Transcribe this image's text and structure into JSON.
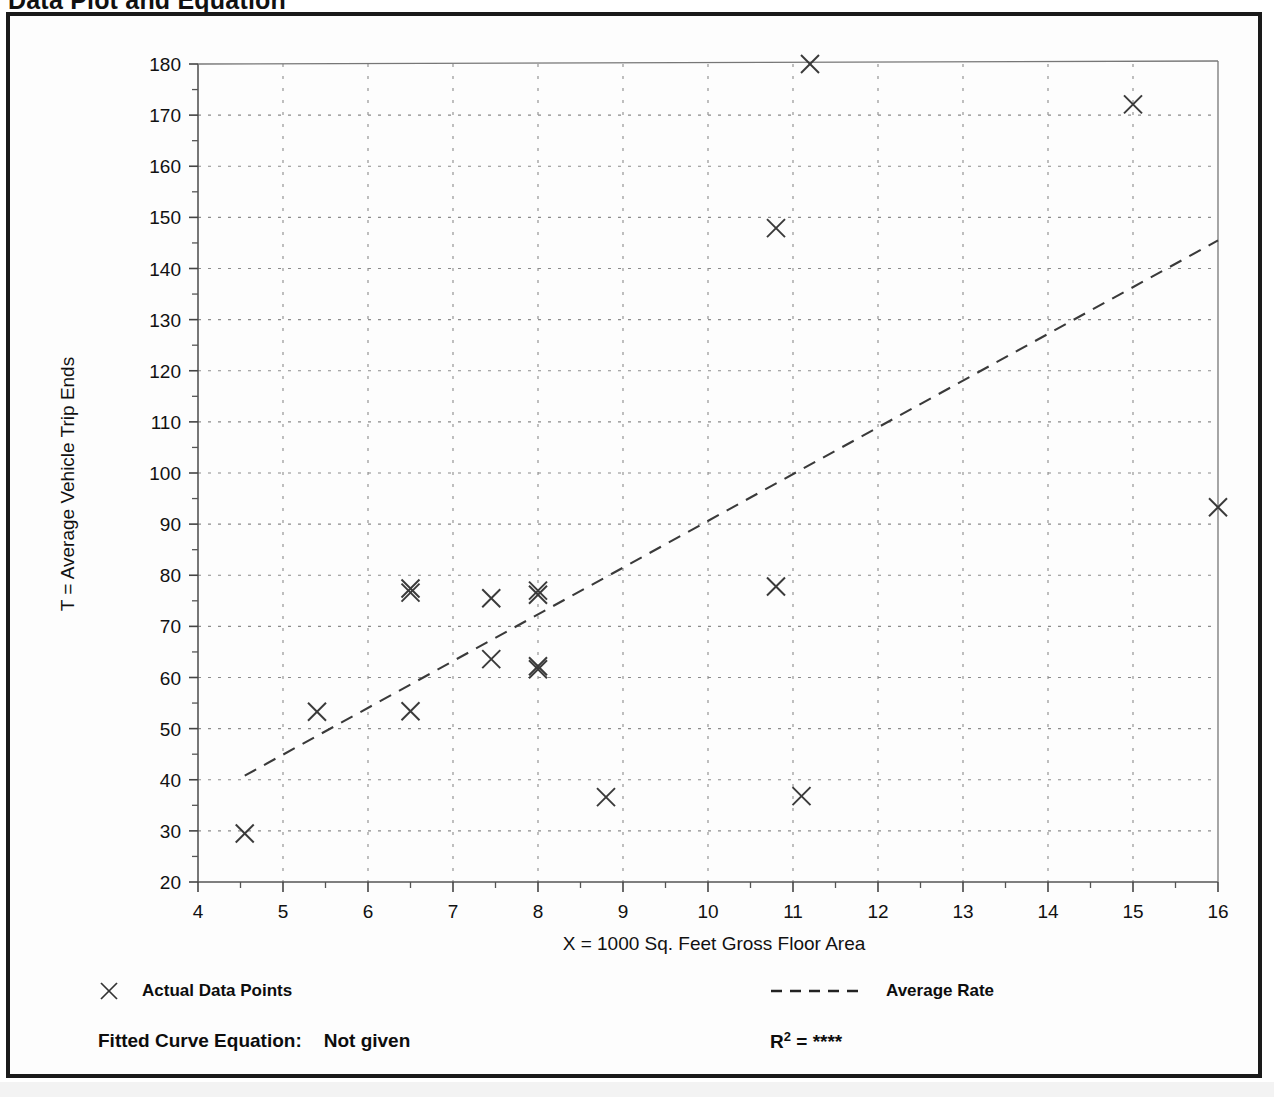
{
  "page": {
    "title": "Data Plot and Equation"
  },
  "chart_data": {
    "type": "scatter",
    "title": "Data Plot and Equation",
    "xlabel": "X = 1000 Sq. Feet Gross Floor Area",
    "ylabel": "T = Average Vehicle Trip Ends",
    "xlim": [
      4,
      16
    ],
    "ylim": [
      20,
      180
    ],
    "xticks": [
      4,
      5,
      6,
      7,
      8,
      9,
      10,
      11,
      12,
      13,
      14,
      15,
      16
    ],
    "yticks": [
      20,
      30,
      40,
      50,
      60,
      70,
      80,
      90,
      100,
      110,
      120,
      130,
      140,
      150,
      160,
      170,
      180
    ],
    "xtick_labels": [
      "4",
      "5",
      "6",
      "7",
      "8",
      "9",
      "10",
      "11",
      "12",
      "13",
      "14",
      "15",
      "16"
    ],
    "ytick_labels": [
      "20",
      "30",
      "40",
      "50",
      "60",
      "70",
      "80",
      "90",
      "100",
      "110",
      "120",
      "130",
      "140",
      "150",
      "160",
      "170",
      "180"
    ],
    "minor_ticks": true,
    "grid": true,
    "grid_style": "dotted",
    "marker": "x",
    "marker_color": "#3a3a3a",
    "series": [
      {
        "name": "Actual Data Points",
        "marker": "x",
        "points": [
          {
            "x": 4.55,
            "y": 29.5
          },
          {
            "x": 5.4,
            "y": 53.3
          },
          {
            "x": 6.5,
            "y": 53.4
          },
          {
            "x": 6.5,
            "y": 76.6
          },
          {
            "x": 6.5,
            "y": 77.4
          },
          {
            "x": 7.45,
            "y": 63.6
          },
          {
            "x": 7.45,
            "y": 75.5
          },
          {
            "x": 8.0,
            "y": 61.6
          },
          {
            "x": 8.0,
            "y": 62.2
          },
          {
            "x": 8.0,
            "y": 76.2
          },
          {
            "x": 8.0,
            "y": 77.0
          },
          {
            "x": 8.8,
            "y": 36.6
          },
          {
            "x": 10.8,
            "y": 147.9
          },
          {
            "x": 10.8,
            "y": 77.8
          },
          {
            "x": 11.1,
            "y": 36.8
          },
          {
            "x": 11.2,
            "y": 180.0
          },
          {
            "x": 15.0,
            "y": 172.1
          },
          {
            "x": 16.0,
            "y": 93.3
          }
        ]
      }
    ],
    "trendline": {
      "name": "Average Rate",
      "style": "dashed",
      "color": "#3a3a3a",
      "x_start": 4.55,
      "y_start": 40.8,
      "x_end": 16.0,
      "y_end": 145.5
    },
    "legend": [
      {
        "label": "Actual Data Points",
        "symbol": "x-marker",
        "position": "bottom-left"
      },
      {
        "label": "Average Rate",
        "symbol": "dashed-line",
        "position": "bottom-right"
      }
    ],
    "annotations": {
      "fitted_curve_equation_label": "Fitted Curve Equation:",
      "fitted_curve_equation_value": "Not given",
      "r_squared_label": "R",
      "r_squared_exponent": "2",
      "r_squared_equals": "=",
      "r_squared_value": "****"
    }
  }
}
